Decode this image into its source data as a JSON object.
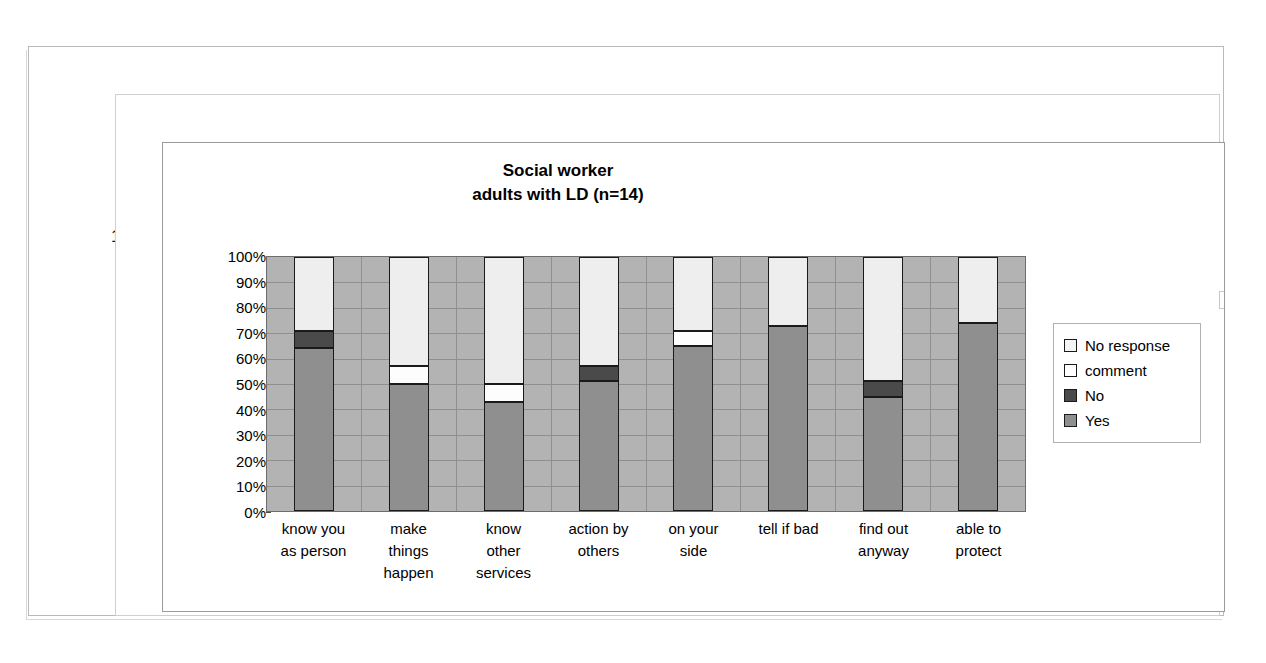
{
  "page": {
    "page_number": "1"
  },
  "chart_data": {
    "type": "bar",
    "subtype": "stacked-100-percent",
    "title": "Social worker",
    "subtitle": "adults with LD (n=14)",
    "xlabel": "",
    "ylabel": "",
    "ylim": [
      0,
      100
    ],
    "ytick_labels": [
      "100%",
      "90%",
      "80%",
      "70%",
      "60%",
      "50%",
      "40%",
      "30%",
      "20%",
      "10%",
      "0%"
    ],
    "ytick_values": [
      100,
      90,
      80,
      70,
      60,
      50,
      40,
      30,
      20,
      10,
      0
    ],
    "grid": true,
    "legend_position": "right",
    "categories": [
      "know you as person",
      "make things happen",
      "know other services",
      "action by others",
      "on your side",
      "tell if bad",
      "find out anyway",
      "able to protect"
    ],
    "category_lines": [
      [
        "know you",
        "as person"
      ],
      [
        "make",
        "things",
        "happen"
      ],
      [
        "know",
        "other",
        "services"
      ],
      [
        "action by",
        "others"
      ],
      [
        "on your",
        "side"
      ],
      [
        "tell if bad"
      ],
      [
        "find out",
        "anyway"
      ],
      [
        "able to",
        "protect"
      ]
    ],
    "series": [
      {
        "name": "Yes",
        "color": "#8f8f8f",
        "values": [
          64,
          50,
          43,
          51,
          65,
          73,
          45,
          74
        ]
      },
      {
        "name": "No",
        "color": "#4a4a4a",
        "values": [
          7,
          0,
          0,
          6,
          0,
          0,
          6,
          0
        ]
      },
      {
        "name": "comment",
        "color": "#ffffff",
        "values": [
          0,
          7,
          7,
          0,
          6,
          0,
          0,
          0
        ]
      },
      {
        "name": "No response",
        "color": "#f4f4f4",
        "values": [
          29,
          43,
          50,
          43,
          29,
          27,
          49,
          26
        ]
      }
    ],
    "legend_entries": [
      {
        "label": "No response",
        "color": "#f4f4f4"
      },
      {
        "label": "comment",
        "color": "#ffffff"
      },
      {
        "label": "No",
        "color": "#4a4a4a"
      },
      {
        "label": "Yes",
        "color": "#8f8f8f"
      }
    ],
    "plot_background": "#b3b3b3"
  }
}
